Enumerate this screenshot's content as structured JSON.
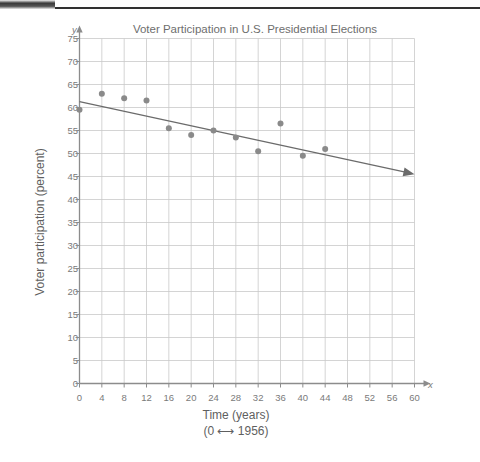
{
  "chart_data": {
    "type": "scatter",
    "title": "Voter Participation in U.S. Presidential Elections",
    "xlabel": "Time (years)",
    "xlabel_sub": "(0 ⟷ 1956)",
    "ylabel": "Voter participation (percent)",
    "xlim": [
      0,
      60
    ],
    "ylim": [
      0,
      75
    ],
    "xticks": [
      0,
      4,
      8,
      12,
      16,
      20,
      24,
      28,
      32,
      36,
      40,
      44,
      48,
      52,
      56,
      60
    ],
    "yticks": [
      0,
      5,
      10,
      15,
      20,
      25,
      30,
      35,
      40,
      45,
      50,
      55,
      60,
      65,
      70,
      75
    ],
    "grid": true,
    "legend": "none",
    "x": [
      0,
      4,
      8,
      12,
      16,
      20,
      24,
      28,
      32,
      36,
      40,
      44
    ],
    "values": [
      59.5,
      63.0,
      62.0,
      61.5,
      55.5,
      54.0,
      55.0,
      53.5,
      50.5,
      56.5,
      49.5,
      51.0
    ],
    "series": [
      {
        "name": "Voter participation",
        "marker": "filled-circle",
        "color": "#8a8a8a",
        "points": [
          {
            "x": 0,
            "y": 59.5
          },
          {
            "x": 4,
            "y": 63.0
          },
          {
            "x": 8,
            "y": 62.0
          },
          {
            "x": 12,
            "y": 61.5
          },
          {
            "x": 16,
            "y": 55.5
          },
          {
            "x": 20,
            "y": 54.0
          },
          {
            "x": 24,
            "y": 55.0
          },
          {
            "x": 28,
            "y": 53.5
          },
          {
            "x": 32,
            "y": 50.5
          },
          {
            "x": 36,
            "y": 56.5
          },
          {
            "x": 40,
            "y": 49.5
          },
          {
            "x": 44,
            "y": 51.0
          }
        ]
      },
      {
        "name": "Trend line",
        "type": "line",
        "color": "#6b6b6b",
        "arrow_end": true,
        "start": {
          "x": 0,
          "y": 61.3
        },
        "end": {
          "x": 60,
          "y": 45.5
        }
      }
    ],
    "colors": {
      "grid": "#c9c9c9",
      "axis": "#8c8c8c",
      "marker": "#8a8a8a",
      "trend": "#6b6b6b",
      "text": "#6f6f6f",
      "background": "#ffffff"
    }
  }
}
